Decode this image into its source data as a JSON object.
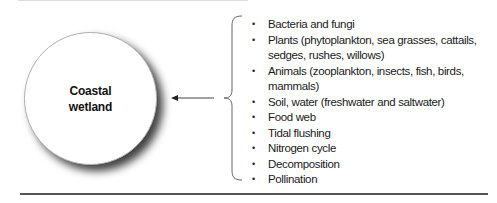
{
  "diagram": {
    "center_node": {
      "label_line1": "Coastal",
      "label_line2": "wetland"
    },
    "components": [
      "Bacteria and fungi",
      "Plants (phytoplankton, sea grasses, cattails, sedges, rushes, willows)",
      "Animals (zooplankton, insects, fish, birds, mammals)",
      "Soil, water (freshwater and saltwater)",
      "Food web",
      "Tidal flushing",
      "Nitrogen cycle",
      "Decomposition",
      "Pollination"
    ],
    "colors": {
      "text": "#1a1a1a",
      "shadow": "#000000",
      "rule": "#555555"
    }
  }
}
